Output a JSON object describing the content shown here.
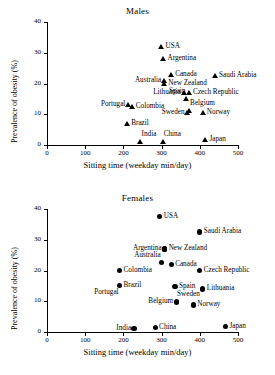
{
  "figure": {
    "panels": [
      "Males",
      "Females"
    ]
  },
  "chart_data": [
    {
      "type": "scatter",
      "title": "Males",
      "xlabel": "Sitting time (weekday min/day)",
      "ylabel": "Prevalence of obesity (%)",
      "xlim": [
        0,
        500
      ],
      "ylim": [
        0,
        40
      ],
      "xticks": [
        0,
        100,
        200,
        300,
        400,
        500
      ],
      "yticks": [
        0,
        10,
        20,
        30,
        40
      ],
      "grid": false,
      "legend": "none",
      "marker": "triangle",
      "points": [
        {
          "label": "USA",
          "x": 300,
          "y": 32.0,
          "lp": "right"
        },
        {
          "label": "Argentina",
          "x": 305,
          "y": 28.0,
          "lp": "right"
        },
        {
          "label": "Canada",
          "x": 325,
          "y": 23.0,
          "lp": "right"
        },
        {
          "label": "Saudi Arabia",
          "x": 440,
          "y": 22.5,
          "lp": "right"
        },
        {
          "label": "Australia",
          "x": 307,
          "y": 21.0,
          "lp": "left"
        },
        {
          "label": "New Zealand",
          "x": 307,
          "y": 20.0,
          "lp": "right"
        },
        {
          "label": "Lithuania",
          "x": 358,
          "y": 17.0,
          "lp": "left"
        },
        {
          "label": "Czech Republic",
          "x": 372,
          "y": 17.0,
          "lp": "right"
        },
        {
          "label": "Spain",
          "x": 365,
          "y": 15.0,
          "lp": "above-left"
        },
        {
          "label": "Portugal",
          "x": 213,
          "y": 13.0,
          "lp": "left"
        },
        {
          "label": "Colombia",
          "x": 222,
          "y": 12.5,
          "lp": "right"
        },
        {
          "label": "Belgium",
          "x": 372,
          "y": 11.0,
          "lp": "above-right"
        },
        {
          "label": "Sweden",
          "x": 368,
          "y": 10.5,
          "lp": "left"
        },
        {
          "label": "Norway",
          "x": 408,
          "y": 10.5,
          "lp": "right"
        },
        {
          "label": "Brazil",
          "x": 210,
          "y": 7.0,
          "lp": "right"
        },
        {
          "label": "India",
          "x": 245,
          "y": 1.0,
          "lp": "above-right"
        },
        {
          "label": "China",
          "x": 303,
          "y": 1.0,
          "lp": "above-right"
        },
        {
          "label": "Japan",
          "x": 415,
          "y": 1.8,
          "lp": "right"
        }
      ]
    },
    {
      "type": "scatter",
      "title": "Females",
      "xlabel": "Sitting time (weekday min/day)",
      "ylabel": "Prevalence of obesity (%)",
      "xlim": [
        0,
        500
      ],
      "ylim": [
        0,
        40
      ],
      "xticks": [
        0,
        100,
        200,
        300,
        400,
        500
      ],
      "yticks": [
        0,
        10,
        20,
        30,
        40
      ],
      "grid": false,
      "legend": "none",
      "marker": "circle",
      "points": [
        {
          "label": "USA",
          "x": 295,
          "y": 37.5,
          "lp": "right"
        },
        {
          "label": "Saudi Arabia",
          "x": 400,
          "y": 32.5,
          "lp": "right"
        },
        {
          "label": "Argentina",
          "x": 308,
          "y": 27.0,
          "lp": "left"
        },
        {
          "label": "New Zealand",
          "x": 308,
          "y": 27.0,
          "lp": "right"
        },
        {
          "label": "Australia",
          "x": 300,
          "y": 22.5,
          "lp": "above-left"
        },
        {
          "label": "Canada",
          "x": 325,
          "y": 22.0,
          "lp": "right"
        },
        {
          "label": "Colombia",
          "x": 190,
          "y": 20.0,
          "lp": "right"
        },
        {
          "label": "Czech Republic",
          "x": 400,
          "y": 20.0,
          "lp": "right"
        },
        {
          "label": "Brazil",
          "x": 190,
          "y": 15.0,
          "lp": "right"
        },
        {
          "label": "Spain",
          "x": 335,
          "y": 14.7,
          "lp": "right"
        },
        {
          "label": "Lithuania",
          "x": 408,
          "y": 14.0,
          "lp": "right"
        },
        {
          "label": "Portugal",
          "x": 190,
          "y": 15.0,
          "lp": "below-left"
        },
        {
          "label": "Belgium",
          "x": 338,
          "y": 10.0,
          "lp": "left"
        },
        {
          "label": "Sweden",
          "x": 338,
          "y": 9.7,
          "lp": "above-right"
        },
        {
          "label": "Norway",
          "x": 383,
          "y": 8.8,
          "lp": "right"
        },
        {
          "label": "India",
          "x": 228,
          "y": 1.2,
          "lp": "left"
        },
        {
          "label": "China",
          "x": 283,
          "y": 1.5,
          "lp": "right"
        },
        {
          "label": "Japan",
          "x": 467,
          "y": 1.8,
          "lp": "right"
        }
      ]
    }
  ]
}
